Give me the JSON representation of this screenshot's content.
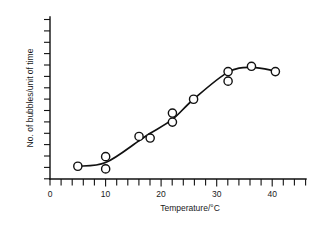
{
  "figure": {
    "background_color": "#ffffff",
    "ink_color": "#111111",
    "marker_fill": "#ffffff"
  },
  "chart_data": {
    "type": "scatter",
    "title": "",
    "subtitle": "",
    "xlabel": "Temperature/°C",
    "ylabel": "No. of bubbles/unit of time",
    "xlim": [
      0,
      46
    ],
    "ylim": [
      0,
      15
    ],
    "grid": false,
    "legend": null,
    "legend_position": "none",
    "x_major_ticks": [
      0,
      10,
      20,
      30,
      40
    ],
    "x_major_tick_labels": [
      "0",
      "10",
      "20",
      "30",
      "40"
    ],
    "x_minor_tick_step": 2,
    "x_minor_ticks": [
      0,
      2,
      4,
      6,
      8,
      10,
      12,
      14,
      16,
      18,
      20,
      22,
      24,
      26,
      28,
      30,
      32,
      34,
      36,
      38,
      40,
      42,
      44,
      46
    ],
    "y_tick_count": 15,
    "y_tick_labels": [],
    "y_axis_note": "unlabelled evenly spaced ticks, arbitrary units",
    "points": [
      {
        "x": 5,
        "y": 1.2
      },
      {
        "x": 10,
        "y": 2.1
      },
      {
        "x": 10,
        "y": 0.95
      },
      {
        "x": 16,
        "y": 4.0
      },
      {
        "x": 18,
        "y": 3.85
      },
      {
        "x": 22,
        "y": 6.2
      },
      {
        "x": 22,
        "y": 5.35
      },
      {
        "x": 25.8,
        "y": 7.5
      },
      {
        "x": 32,
        "y": 10.1
      },
      {
        "x": 32,
        "y": 9.2
      },
      {
        "x": 36.2,
        "y": 10.6
      },
      {
        "x": 40.5,
        "y": 10.1
      }
    ],
    "fitted_curve": {
      "description": "smooth sigmoid best-fit curve rising from 5°C, steepest near 22°C, peaking near 36°C then declining slightly",
      "x": [
        5,
        10,
        16,
        18,
        22,
        25.8,
        32,
        36.2,
        40.5
      ],
      "y": [
        1.2,
        1.55,
        3.6,
        4.3,
        5.6,
        7.5,
        10.05,
        10.5,
        10.15
      ]
    }
  }
}
